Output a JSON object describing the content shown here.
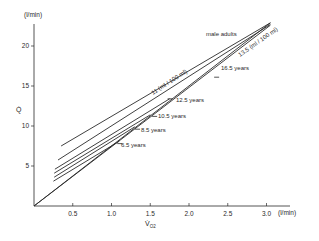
{
  "chart_data": {
    "type": "line",
    "title": "",
    "xlabel": "V̇O2",
    "ylabel": "Q̇",
    "x_unit": "(l/min)",
    "y_unit": "(l/min)",
    "xlim": [
      0,
      3.4
    ],
    "ylim": [
      0,
      23.5
    ],
    "x_ticks": [
      0.5,
      1.0,
      1.5,
      2.0,
      2.5,
      3.0
    ],
    "x_tick_labels": [
      "0.5",
      "1.0",
      "1.5",
      "2.0",
      "2.5",
      "3.0"
    ],
    "y_ticks": [
      5,
      10,
      15,
      20
    ],
    "y_tick_labels": [
      "5",
      "10",
      "15",
      "20"
    ],
    "grid": false,
    "legend": "none (inline line labels)",
    "series": [
      {
        "name": "11 ml / 100 ml (reference)",
        "x": [
          0,
          3.05
        ],
        "y": [
          0,
          22.9
        ]
      },
      {
        "name": "13.5 ml / 100 ml (reference)",
        "x": [
          0,
          3.05
        ],
        "y": [
          0,
          22.6
        ]
      },
      {
        "name": "male adults",
        "x": [
          0.35,
          3.05
        ],
        "y": [
          7.5,
          22.9
        ]
      },
      {
        "name": "16.5 years",
        "x": [
          0.31,
          3.05
        ],
        "y": [
          5.75,
          22.7
        ]
      },
      {
        "name": "12.5 years",
        "x": [
          0.27,
          1.75
        ],
        "y": [
          4.6,
          13.4
        ]
      },
      {
        "name": "10.5 years",
        "x": [
          0.26,
          1.5
        ],
        "y": [
          4.1,
          11.4
        ]
      },
      {
        "name": "8.5 years",
        "x": [
          0.26,
          1.3
        ],
        "y": [
          3.6,
          9.9
        ]
      },
      {
        "name": "6.5 years",
        "x": [
          0.25,
          1.1
        ],
        "y": [
          3.1,
          8.1
        ]
      }
    ],
    "annotations": [
      {
        "text": "male adults",
        "x": 2.45,
        "y": 21.1
      },
      {
        "text": "11 (ml / 100 ml)",
        "x": 1.6,
        "y": 16.5,
        "rotated": true
      },
      {
        "text": "13.5 (ml / 100 ml)",
        "x": 2.8,
        "y": 19.8,
        "rotated": true
      },
      {
        "text": "16.5 years",
        "x": 2.4,
        "y": 16.2
      },
      {
        "text": "12.5 years",
        "x": 1.8,
        "y": 13.3
      },
      {
        "text": "10.5 years",
        "x": 1.6,
        "y": 11.0
      },
      {
        "text": "8.5 years",
        "x": 1.38,
        "y": 9.4
      },
      {
        "text": "6.5 years",
        "x": 1.15,
        "y": 7.6
      }
    ]
  },
  "labels": {
    "y_unit": "(l/min)",
    "x_unit": "(l/min)",
    "y_axis_symbol": "Q̇",
    "x_axis_symbol": "V̇",
    "x_axis_subscript": "O2",
    "male_adults": "male  adults",
    "ref_11": "11 (ml / 100 ml)",
    "ref_13": "13.5 (ml / 100 ml)",
    "age_16": "16.5 years",
    "age_12": "12.5 years",
    "age_10": "10.5 years",
    "age_8": "8.5 years",
    "age_6": "6.5 years"
  },
  "colors": {
    "ink": "#2a2a2a",
    "background": "#ffffff"
  }
}
